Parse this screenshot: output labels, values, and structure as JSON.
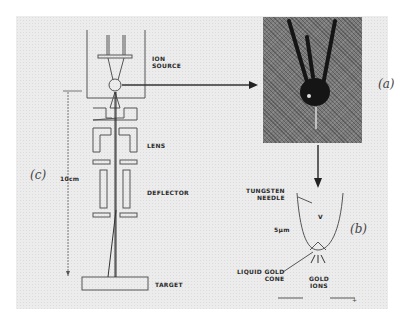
{
  "figure": {
    "panels": [
      {
        "id": "a",
        "label": "(a)",
        "description": "photograph of ion source emitter assembly"
      },
      {
        "id": "b",
        "label": "(b)",
        "description": "tungsten needle tip with liquid gold cone"
      },
      {
        "id": "c",
        "label": "(c)",
        "description": "ion beam column schematic"
      }
    ],
    "column": {
      "ion_source": "ION\nSOURCE",
      "lens": "LENS",
      "deflector": "DEFLECTOR",
      "target": "TARGET",
      "dimension": "10cm"
    },
    "needle": {
      "tungsten_needle": "TUNGSTEN\nNEEDLE",
      "scale": "5µm",
      "liquid_gold_cone": "LIQUID GOLD\nCONE",
      "gold_ions": "GOLD\nIONS",
      "v_mark": "V"
    },
    "photo_scale_text": "scale mark"
  },
  "colors": {
    "panel_bg": "#ececec",
    "line": "#555555",
    "text": "#2a2a2a",
    "photo_dark": "#1a1a1a"
  }
}
